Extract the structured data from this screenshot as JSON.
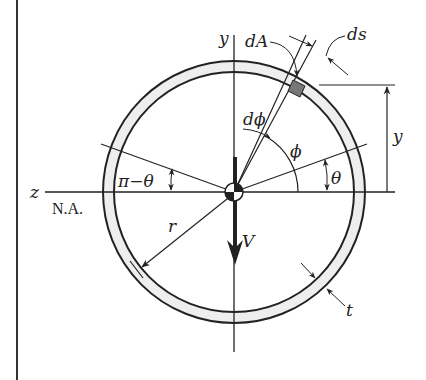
{
  "diagram": {
    "labels": {
      "y_axis": "y",
      "z_axis": "z",
      "neutral_axis": "N.A.",
      "dA": "dA",
      "ds": "ds",
      "dphi": "dϕ",
      "phi": "ϕ",
      "theta_right": "θ",
      "pi_minus_theta": "π−θ",
      "y_dimension": "y",
      "radius": "r",
      "shear_force": "V",
      "thickness": "t"
    },
    "geometry": {
      "center": [
        234,
        192
      ],
      "outer_radius": 131,
      "inner_radius": 120,
      "theta_deg": 20,
      "phi_deg": 58
    },
    "colors": {
      "line": "#222222",
      "ring_fill": "#eeeeee",
      "element_fill": "#777777",
      "background": "#ffffff"
    }
  }
}
